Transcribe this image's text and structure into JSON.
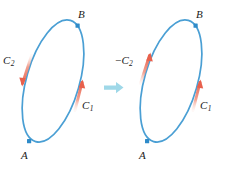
{
  "figure": {
    "colors": {
      "curve": "#4a9fd4",
      "curve_dark": "#3a90c8",
      "arrow_segment": "#e8604c",
      "arrow_segment_light": "#f4a593",
      "point_marker": "#2e8bc9",
      "transition_arrow": "#9fd8e8",
      "label_text": "#1a1a1a",
      "background": "#ffffff"
    }
  },
  "left_panel": {
    "name": "original-curve",
    "point_b": "B",
    "point_a": "A",
    "arc_c2_label": "C",
    "arc_c2_sub": "2",
    "arc_c2_prefix": "",
    "arc_c2_direction": "downward",
    "arc_c1_label": "C",
    "arc_c1_sub": "1",
    "arc_c1_direction": "upward"
  },
  "right_panel": {
    "name": "reversed-curve",
    "point_b": "B",
    "point_a": "A",
    "arc_c2_label": "C",
    "arc_c2_sub": "2",
    "arc_c2_prefix": "−",
    "arc_c2_direction": "upward",
    "arc_c1_label": "C",
    "arc_c1_sub": "1",
    "arc_c1_direction": "upward"
  },
  "transition": {
    "name": "implies-arrow",
    "direction": "right",
    "glyph": "⇒"
  }
}
